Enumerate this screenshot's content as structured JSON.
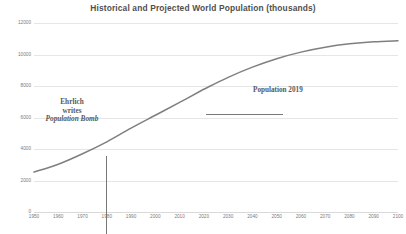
{
  "chart_data": {
    "type": "line",
    "title": "Historical and Projected World Population (thousands)",
    "xlabel": "",
    "ylabel": "",
    "xlim": [
      1950,
      2100
    ],
    "ylim": [
      0,
      12000
    ],
    "grid": true,
    "legend": "none",
    "x_ticks": [
      "1950",
      "1960",
      "1970",
      "1980",
      "1990",
      "2000",
      "2010",
      "2020",
      "2030",
      "2040",
      "2050",
      "2060",
      "2070",
      "2080",
      "2090",
      "2100"
    ],
    "y_ticks": [
      "0",
      "2000",
      "4000",
      "6000",
      "8000",
      "10000",
      "12000"
    ],
    "series": [
      {
        "name": "World Population",
        "color": "#7f7f7f",
        "x": [
          1950,
          1960,
          1970,
          1980,
          1990,
          2000,
          2010,
          2019,
          2020,
          2030,
          2040,
          2050,
          2060,
          2070,
          2080,
          2090,
          2100
        ],
        "values": [
          2536,
          3033,
          3700,
          4458,
          5327,
          6144,
          6957,
          7713,
          7795,
          8548,
          9199,
          9735,
          10152,
          10460,
          10675,
          10810,
          10875
        ]
      }
    ],
    "annotations": [
      {
        "name": "ehrlich-annotation",
        "lines": [
          "Ehrlich",
          "writes",
          "Population Bomb"
        ],
        "italic_line": "Population Bomb",
        "x": 1968,
        "marker": "vertical-line"
      },
      {
        "name": "population-2019-annotation",
        "label": "Population 2019",
        "x": 2019,
        "y": 7713,
        "marker": "horizontal-leader-line"
      }
    ]
  },
  "colors": {
    "curve": "#7f7f7f",
    "gridline": "#e6e6e6",
    "tick_text": "#7a7a7a",
    "title_text": "#4f4f4f",
    "annotation_text": "#595959",
    "annotation_line": "#787878",
    "background": "#ffffff"
  }
}
